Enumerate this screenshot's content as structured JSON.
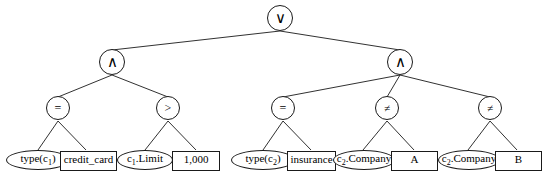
{
  "diagram": {
    "stroke_color": "#1a1a1a",
    "fill_color": "#ffffff",
    "nodes": {
      "root": {
        "label": "∨",
        "name": "or-operator"
      },
      "and_left": {
        "label": "∧",
        "name": "and-operator-left"
      },
      "and_right": {
        "label": "∧",
        "name": "and-operator-right"
      },
      "eq_1": {
        "label": "=",
        "name": "equals-operator-1"
      },
      "gt_1": {
        "label": ">",
        "name": "greater-than-operator"
      },
      "eq_2": {
        "label": "=",
        "name": "equals-operator-2"
      },
      "neq_1": {
        "label": "≠",
        "name": "not-equals-operator-1"
      },
      "neq_2": {
        "label": "≠",
        "name": "not-equals-operator-2"
      }
    },
    "leaves": [
      {
        "id": "type_c1",
        "shape": "ellipse",
        "text": "type(c",
        "sub": "1",
        "suffix": ")"
      },
      {
        "id": "credit_card",
        "shape": "rectangle",
        "text": "credit_card",
        "sub": "",
        "suffix": ""
      },
      {
        "id": "c1_limit",
        "shape": "ellipse",
        "text": "c",
        "sub": "1",
        "suffix": ".Limit"
      },
      {
        "id": "thousand",
        "shape": "rectangle",
        "text": "1,000",
        "sub": "",
        "suffix": ""
      },
      {
        "id": "type_c2",
        "shape": "ellipse",
        "text": "type(c",
        "sub": "2",
        "suffix": ")"
      },
      {
        "id": "insurance",
        "shape": "rectangle",
        "text": "insurance",
        "sub": "",
        "suffix": ""
      },
      {
        "id": "c2_company_a",
        "shape": "ellipse",
        "text": "c",
        "sub": "2",
        "suffix": ".Company"
      },
      {
        "id": "value_a",
        "shape": "rectangle",
        "text": "A",
        "sub": "",
        "suffix": ""
      },
      {
        "id": "c2_company_b",
        "shape": "ellipse",
        "text": "c",
        "sub": "2",
        "suffix": ".Company"
      },
      {
        "id": "value_b",
        "shape": "rectangle",
        "text": "B",
        "sub": "",
        "suffix": ""
      }
    ]
  }
}
